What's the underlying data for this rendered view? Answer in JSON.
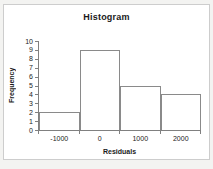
{
  "chart_data": {
    "type": "bar",
    "subtype": "histogram",
    "title": "Histogram",
    "xlabel": "Residuals",
    "ylabel": "Frequency",
    "categories": [
      "-1000",
      "0",
      "1000",
      "2000"
    ],
    "values": [
      2,
      9,
      5,
      4
    ],
    "bin_width": 1000,
    "bin_edges": [
      -1500,
      -500,
      500,
      1500,
      2500
    ],
    "ylim": [
      0,
      10
    ],
    "y_ticks": [
      0,
      1,
      2,
      3,
      4,
      5,
      6,
      7,
      8,
      9,
      10
    ],
    "grid": false,
    "legend": false,
    "gap_width": 0
  },
  "colors": {
    "plot_background": "#ffffff",
    "outer_background": "#f3f3f1",
    "frame_border": "#cdcdcd",
    "axis_color": "#808080",
    "bar_fill": "#ffffff",
    "bar_border": "#8a8a8a",
    "text_color": "#1a1a1a"
  }
}
